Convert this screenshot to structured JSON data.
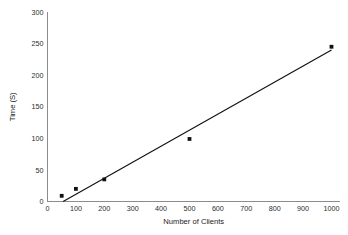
{
  "chart_data": {
    "type": "scatter",
    "title": "",
    "xlabel": "Number of Clients",
    "ylabel": "Time (S)",
    "xlim": [
      0,
      1030
    ],
    "ylim": [
      0,
      300
    ],
    "grid": false,
    "legend": null,
    "x_ticks": [
      0,
      100,
      200,
      300,
      400,
      500,
      600,
      700,
      800,
      900,
      1000
    ],
    "x_tick_labels": [
      "0",
      "100",
      "200",
      "300",
      "400",
      "500",
      "600",
      "700",
      "800",
      "900",
      "1000"
    ],
    "y_ticks": [
      0,
      50,
      100,
      150,
      200,
      250,
      300
    ],
    "y_tick_labels": [
      "0",
      "50",
      "100",
      "150",
      "200",
      "250",
      "300"
    ],
    "series": [
      {
        "name": "measurements",
        "type": "scatter",
        "marker": "square",
        "color": "#111111",
        "x": [
          50,
          100,
          200,
          500,
          1000
        ],
        "y": [
          9,
          20,
          35,
          99,
          245
        ]
      },
      {
        "name": "trend-line",
        "type": "line",
        "color": "#111111",
        "x": [
          55,
          1000
        ],
        "y": [
          0,
          240
        ]
      }
    ]
  }
}
